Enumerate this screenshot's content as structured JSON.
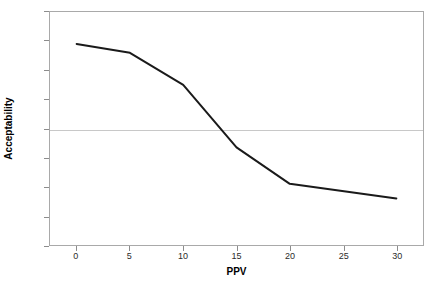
{
  "chart_data": {
    "type": "line",
    "title": "",
    "xlabel": "PPV",
    "ylabel": "Acceptability",
    "x": [
      0,
      5,
      10,
      15,
      20,
      30
    ],
    "values": [
      2.9,
      2.6,
      1.5,
      -0.65,
      -1.9,
      -2.4
    ],
    "series": [
      {
        "name": "Acceptability",
        "x": [
          0,
          5,
          10,
          15,
          20,
          30
        ],
        "values": [
          2.9,
          2.6,
          1.5,
          -0.65,
          -1.9,
          -2.4
        ],
        "color": "#1a1a1a",
        "line_width": 2
      }
    ],
    "xlim": [
      -2.5,
      32.5
    ],
    "ylim": [
      -4,
      4
    ],
    "xticks": [
      0,
      5,
      10,
      15,
      20,
      25,
      30
    ],
    "xtick_labels": [
      "0",
      "5",
      "10",
      "15",
      "20",
      "25",
      "30"
    ],
    "yticks": [
      4,
      3,
      2,
      1,
      0,
      -1,
      -2,
      -3,
      -4
    ],
    "ytick_labels": [
      "4",
      "3",
      "2",
      "1",
      "0",
      "-1",
      "-2",
      "-3",
      "-4"
    ],
    "grid": "zero-line-only",
    "gridline_color": "#c8c8c8",
    "border_color": "#a9a9a9",
    "legend": "none",
    "background": "#ffffff"
  }
}
